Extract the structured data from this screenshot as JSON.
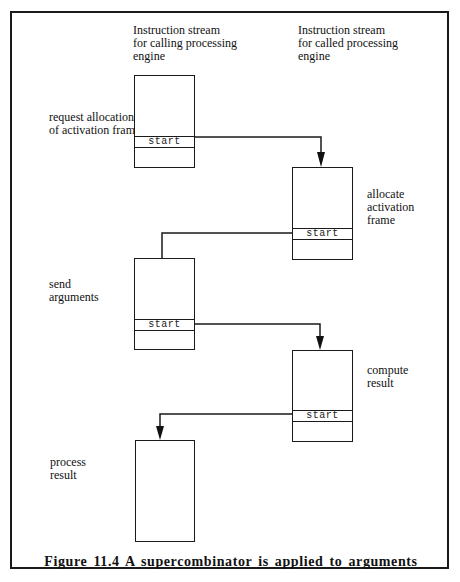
{
  "figure": {
    "caption": "Figure 11.4 A supercombinator is applied to arguments"
  },
  "columns": {
    "calling": {
      "header": [
        "Instruction stream",
        "for calling processing",
        "engine"
      ]
    },
    "called": {
      "header": [
        "Instruction stream",
        "for called processing",
        "engine"
      ]
    }
  },
  "steps": [
    {
      "id": "request",
      "column": "calling",
      "label": [
        "request allocation",
        "of activation frame"
      ],
      "has_start": true,
      "start_label": "start"
    },
    {
      "id": "allocate",
      "column": "called",
      "label": [
        "allocate",
        "activation",
        "frame"
      ],
      "has_start": true,
      "start_label": "start"
    },
    {
      "id": "send",
      "column": "calling",
      "label": [
        "send",
        "arguments"
      ],
      "has_start": true,
      "start_label": "start"
    },
    {
      "id": "compute",
      "column": "called",
      "label": [
        "compute",
        "result"
      ],
      "has_start": true,
      "start_label": "start"
    },
    {
      "id": "process",
      "column": "calling",
      "label": [
        "process",
        "result"
      ],
      "has_start": false
    }
  ],
  "connections": [
    {
      "from": "request",
      "to": "allocate",
      "arrowhead": true
    },
    {
      "from": "allocate",
      "to": "send",
      "arrowhead": false
    },
    {
      "from": "send",
      "to": "compute",
      "arrowhead": true
    },
    {
      "from": "compute",
      "to": "process",
      "arrowhead": true
    }
  ]
}
